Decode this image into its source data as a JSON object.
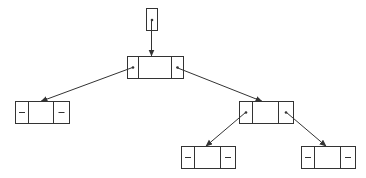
{
  "diagram": {
    "type": "binary-tree-linked-nodes",
    "stroke_color": "#333333",
    "background": "#ffffff",
    "pointer": {
      "x": 146,
      "y": 8,
      "w": 11,
      "h": 22,
      "label": ""
    },
    "nodes": [
      {
        "id": "root",
        "x": 127,
        "y": 56,
        "w": 56,
        "h": 22,
        "d1": 138,
        "d2": 171,
        "left": "pointer",
        "right": "pointer"
      },
      {
        "id": "left",
        "x": 15,
        "y": 101,
        "w": 54,
        "h": 22,
        "d1": 28,
        "d2": 53,
        "left": "null",
        "right": "null"
      },
      {
        "id": "right",
        "x": 239,
        "y": 101,
        "w": 54,
        "h": 22,
        "d1": 252,
        "d2": 278,
        "left": "pointer",
        "right": "pointer"
      },
      {
        "id": "right-left",
        "x": 181,
        "y": 146,
        "w": 54,
        "h": 22,
        "d1": 194,
        "d2": 220,
        "left": "null",
        "right": "null"
      },
      {
        "id": "right-right",
        "x": 301,
        "y": 146,
        "w": 54,
        "h": 22,
        "d1": 314,
        "d2": 340,
        "left": "null",
        "right": "null"
      }
    ],
    "edges": [
      {
        "from": "pointer",
        "x1": 151,
        "y1": 20,
        "x2": 151,
        "y2": 56
      },
      {
        "from": "root.left",
        "x1": 132,
        "y1": 67,
        "x2": 40,
        "y2": 101
      },
      {
        "from": "root.right",
        "x1": 176,
        "y1": 67,
        "x2": 262,
        "y2": 101
      },
      {
        "from": "right.left",
        "x1": 245,
        "y1": 112,
        "x2": 205,
        "y2": 146
      },
      {
        "from": "right.right",
        "x1": 286,
        "y1": 112,
        "x2": 326,
        "y2": 146
      }
    ],
    "null_symbol": "—"
  }
}
